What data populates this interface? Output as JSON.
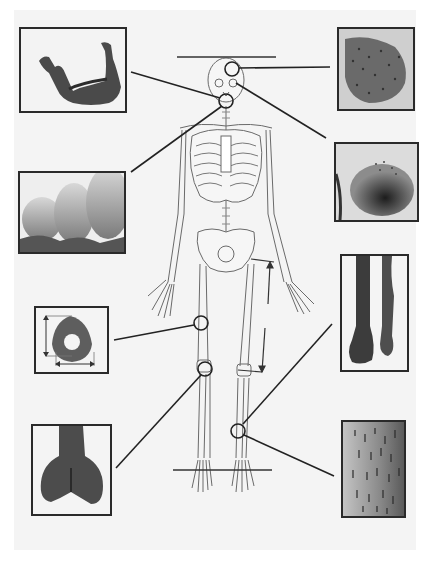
{
  "figure": {
    "type": "labeled-anatomy-diagram",
    "background": "#f4f4f4",
    "line_color": "#222222"
  },
  "insets": [
    {
      "id": "mandible",
      "depicts": "lower jaw bone (mandible) photograph",
      "box": [
        19,
        27,
        107,
        85
      ],
      "target": "jaw",
      "circle": [
        226,
        101
      ]
    },
    {
      "id": "teeth",
      "depicts": "close-up of molar teeth roots",
      "box": [
        18,
        171,
        108,
        83
      ],
      "target": "teeth",
      "circle": [
        226,
        101
      ]
    },
    {
      "id": "cranial-surface",
      "depicts": "porous bone surface of skull vault",
      "box": [
        337,
        27,
        77,
        83
      ],
      "target": "parietal",
      "circle": [
        232,
        69
      ]
    },
    {
      "id": "orbit",
      "depicts": "eye socket (orbit) roof lesion",
      "box": [
        334,
        142,
        84,
        80
      ],
      "target": "orbit",
      "circle": [
        232,
        83
      ]
    },
    {
      "id": "femur-cross-section",
      "depicts": "femoral shaft cross-section with measurement arrows",
      "box": [
        34,
        306,
        75,
        68
      ],
      "target": "femur midshaft",
      "circle": [
        201,
        323
      ]
    },
    {
      "id": "distal-femur",
      "depicts": "distal end of femur",
      "box": [
        31,
        424,
        81,
        91
      ],
      "target": "knee",
      "circle": [
        205,
        369
      ]
    },
    {
      "id": "long-bones",
      "depicts": "pair of lower-leg long bones",
      "box": [
        340,
        254,
        68,
        117
      ],
      "target": "lower leg",
      "circle": [
        238,
        431
      ]
    },
    {
      "id": "bone-surface",
      "depicts": "striated bone surface texture",
      "box": [
        341,
        420,
        64,
        97
      ],
      "target": "tibia shaft",
      "circle": [
        238,
        431
      ]
    }
  ],
  "annotations": {
    "head_line": "horizontal reference line above skull",
    "foot_line": "horizontal reference line at feet",
    "femur_length": "vertical measurement arrows along left femur"
  }
}
